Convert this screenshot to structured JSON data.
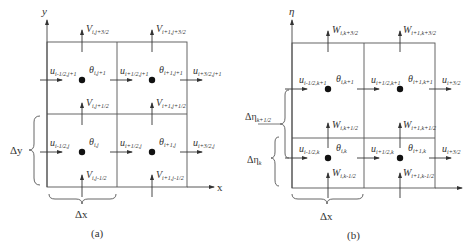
{
  "panel_a": {
    "caption": "(a)",
    "axis_y_label": "y",
    "axis_x_label": "x",
    "dx_label": "Δx",
    "dy_label": "Δy",
    "top_v": [
      {
        "sym": "V",
        "sub": "i,j+3/2"
      },
      {
        "sym": "V",
        "sub": "i+1,j+3/2"
      }
    ],
    "row_upper": {
      "u": [
        {
          "sym": "u",
          "sub": "i-1/2,j+1"
        },
        {
          "sym": "u",
          "sub": "i+1/2,j+1"
        },
        {
          "sym": "u",
          "sub": "i+3/2,j+1"
        }
      ],
      "theta": [
        {
          "sym": "θ",
          "sub": "i,j+1"
        },
        {
          "sym": "θ",
          "sub": "i+1,j+1"
        }
      ]
    },
    "mid_v": [
      {
        "sym": "V",
        "sub": "i,j+1/2"
      },
      {
        "sym": "V",
        "sub": "i+1,j+1/2"
      }
    ],
    "row_lower": {
      "u": [
        {
          "sym": "u",
          "sub": "i-1/2,j"
        },
        {
          "sym": "u",
          "sub": "i+1/2,j"
        },
        {
          "sym": "u",
          "sub": "i+3/2,j"
        }
      ],
      "theta": [
        {
          "sym": "θ",
          "sub": "i,j"
        },
        {
          "sym": "θ",
          "sub": "i+1,j"
        }
      ]
    },
    "bottom_v": [
      {
        "sym": "V",
        "sub": "i,j-1/2"
      },
      {
        "sym": "V",
        "sub": "i+1,j-1/2"
      }
    ]
  },
  "panel_b": {
    "caption": "(b)",
    "axis_y_label": "η",
    "dx_label": "Δx",
    "deta_upper_label": {
      "sym": "Δη",
      "sub": "k+1/2"
    },
    "deta_lower_label": {
      "sym": "Δη",
      "sub": "k"
    },
    "top_w": [
      {
        "sym": "W",
        "sub": "i,k+3/2"
      },
      {
        "sym": "W",
        "sub": "i+1,k+3/2"
      }
    ],
    "row_upper": {
      "u": [
        {
          "sym": "u",
          "sub": "i-1/2,k+1"
        },
        {
          "sym": "u",
          "sub": "i+1/2,k+1"
        },
        {
          "sym": "u",
          "sub": "i+3/2"
        }
      ],
      "theta": [
        {
          "sym": "θ",
          "sub": "i,k+1"
        },
        {
          "sym": "θ",
          "sub": "i+1,k+1"
        }
      ]
    },
    "mid_w": [
      {
        "sym": "W",
        "sub": "i,k+1/2"
      },
      {
        "sym": "W",
        "sub": "i+1,k+1/2"
      }
    ],
    "row_lower": {
      "u": [
        {
          "sym": "u",
          "sub": "i-1/2,k"
        },
        {
          "sym": "u",
          "sub": "i+1/2,k"
        },
        {
          "sym": "u",
          "sub": "i+3/2"
        }
      ],
      "theta": [
        {
          "sym": "θ",
          "sub": "i,k"
        },
        {
          "sym": "θ",
          "sub": "i+1,k"
        }
      ]
    },
    "bottom_w": [
      {
        "sym": "W",
        "sub": "i,k-1/2"
      },
      {
        "sym": "W",
        "sub": "i+1,k-1/2"
      }
    ]
  }
}
